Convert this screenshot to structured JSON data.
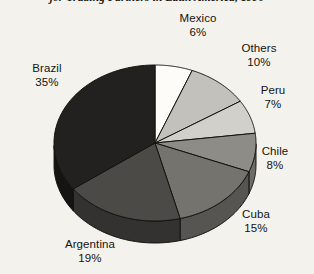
{
  "caption": "jor Trading Partners in Latin America, 1990",
  "chart_data": {
    "type": "pie",
    "title": "jor Trading Partners in Latin America, 1990",
    "xlabel": "",
    "ylabel": "",
    "legend": "none",
    "grid": false,
    "style": "3d-exploded-none",
    "units": "percent",
    "categories": [
      "Mexico",
      "Others",
      "Peru",
      "Chile",
      "Cuba",
      "Argentina",
      "Brazil"
    ],
    "values": [
      6,
      10,
      7,
      8,
      15,
      19,
      35
    ],
    "slices": [
      {
        "label": "Mexico",
        "value": 6,
        "pct_text": "6%",
        "color": "#fdfcf8",
        "side": "#c9c6bf"
      },
      {
        "label": "Others",
        "value": 10,
        "pct_text": "10%",
        "color": "#c3c1bb",
        "side": "#9a9892"
      },
      {
        "label": "Peru",
        "value": 7,
        "pct_text": "7%",
        "color": "#d2d0ca",
        "side": "#a6a49e"
      },
      {
        "label": "Chile",
        "value": 8,
        "pct_text": "8%",
        "color": "#8e8c87",
        "side": "#6e6c68"
      },
      {
        "label": "Cuba",
        "value": 15,
        "pct_text": "15%",
        "color": "#75736e",
        "side": "#575552"
      },
      {
        "label": "Argentina",
        "value": 19,
        "pct_text": "19%",
        "color": "#4c4a47",
        "side": "#343230"
      },
      {
        "label": "Brazil",
        "value": 35,
        "pct_text": "35%",
        "color": "#23211f",
        "side": "#151413"
      }
    ]
  },
  "labels": {
    "mexico": {
      "name": "Mexico",
      "pct": "6%"
    },
    "others": {
      "name": "Others",
      "pct": "10%"
    },
    "peru": {
      "name": "Peru",
      "pct": "7%"
    },
    "chile": {
      "name": "Chile",
      "pct": "8%"
    },
    "cuba": {
      "name": "Cuba",
      "pct": "15%"
    },
    "argentina": {
      "name": "Argentina",
      "pct": "19%"
    },
    "brazil": {
      "name": "Brazil",
      "pct": "35%"
    }
  }
}
